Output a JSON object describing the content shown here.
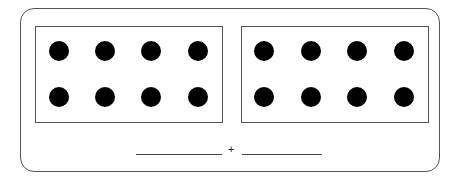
{
  "figure": {
    "groups": [
      {
        "name": "left-group",
        "dot_count": 8,
        "rows": 2,
        "cols": 4
      },
      {
        "name": "right-group",
        "dot_count": 8,
        "rows": 2,
        "cols": 4
      }
    ],
    "equation": {
      "operator": "+",
      "left_blank": "",
      "right_blank": ""
    }
  }
}
